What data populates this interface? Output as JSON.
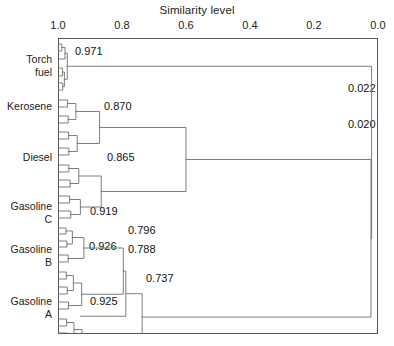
{
  "chart_data": {
    "type": "dendrogram",
    "title": "Similarity level",
    "xlabel": "Similarity level",
    "ylabel": "",
    "axis": {
      "orientation": "top",
      "reversed": true,
      "min": 0.0,
      "max": 1.0,
      "ticks": [
        {
          "value": "1.0",
          "pos": 1.0
        },
        {
          "value": "0.8",
          "pos": 0.8
        },
        {
          "value": "0.6",
          "pos": 0.6
        },
        {
          "value": "0.4",
          "pos": 0.4
        },
        {
          "value": "0.2",
          "pos": 0.2
        },
        {
          "value": "0.0",
          "pos": 0.0
        }
      ]
    },
    "grid": false,
    "legend": null,
    "groups": [
      {
        "name": "Torch fuel",
        "lines": [
          "Torch",
          "fuel"
        ],
        "y": 62,
        "label_y": 53
      },
      {
        "name": "Kerosene",
        "lines": [
          "Kerosene"
        ],
        "y": 106,
        "label_y": 100
      },
      {
        "name": "Diesel",
        "lines": [
          "Diesel"
        ],
        "y": 157,
        "label_y": 151
      },
      {
        "name": "Gasoline C",
        "lines": [
          "Gasoline",
          "C"
        ],
        "y": 208,
        "label_y": 200
      },
      {
        "name": "Gasoline B",
        "lines": [
          "Gasoline",
          "B"
        ],
        "y": 251,
        "label_y": 243
      },
      {
        "name": "Gasoline A",
        "lines": [
          "Gasoline",
          "A"
        ],
        "y": 303,
        "label_y": 295
      }
    ],
    "merge_labels": [
      {
        "text": "0.971",
        "value": 0.971,
        "x": 75,
        "y": 45,
        "cluster": "Torch fuel"
      },
      {
        "text": "0.870",
        "value": 0.87,
        "x": 104,
        "y": 100,
        "cluster": "Kerosene"
      },
      {
        "text": "0.865",
        "value": 0.865,
        "x": 107,
        "y": 151,
        "cluster": "Diesel"
      },
      {
        "text": "0.919",
        "value": 0.919,
        "x": 90,
        "y": 205,
        "cluster": "Gasoline C"
      },
      {
        "text": "0.926",
        "value": 0.926,
        "x": 89,
        "y": 240,
        "cluster": "Gasoline B"
      },
      {
        "text": "0.796",
        "value": 0.796,
        "x": 128,
        "y": 224,
        "cluster": "Gasoline C + B upper"
      },
      {
        "text": "0.788",
        "value": 0.788,
        "x": 128,
        "y": 243,
        "cluster": "Gasoline C + B"
      },
      {
        "text": "0.737",
        "value": 0.737,
        "x": 146,
        "y": 272,
        "cluster": "All gasolines"
      },
      {
        "text": "0.925",
        "value": 0.925,
        "x": 90,
        "y": 295,
        "cluster": "Gasoline A"
      },
      {
        "text": "0.022",
        "value": 0.022,
        "x": 348,
        "y": 82,
        "cluster": "Torch fuel + rest"
      },
      {
        "text": "0.020",
        "value": 0.02,
        "x": 348,
        "y": 118,
        "cluster": "Root"
      }
    ],
    "merge_values": [
      0.971,
      0.87,
      0.865,
      0.919,
      0.926,
      0.796,
      0.788,
      0.737,
      0.925,
      0.022,
      0.02
    ],
    "colors": {
      "line": "#6f6f6f",
      "frame": "#555555",
      "text": "#1b1b1b",
      "background": "#ffffff"
    }
  }
}
